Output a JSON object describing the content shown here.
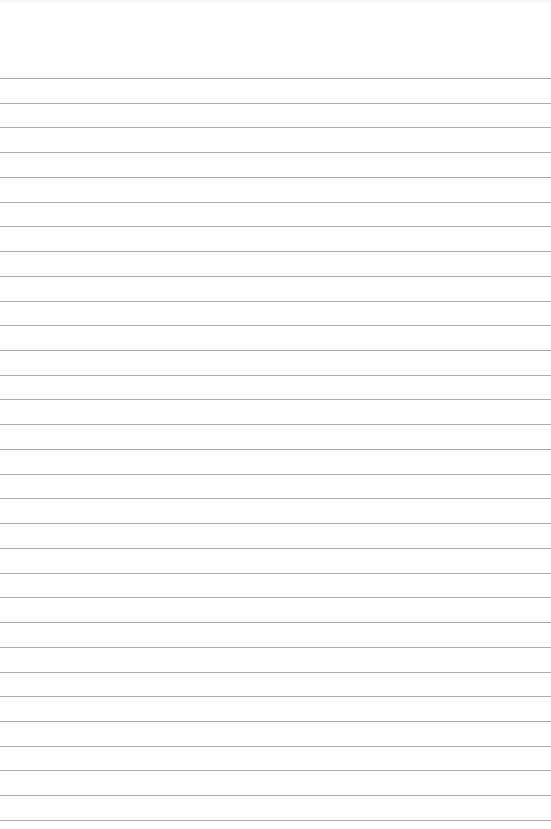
{
  "page": {
    "type": "lined-paper",
    "background_color": "#fefefe",
    "rule_color": "#9a9a9a",
    "first_rule_y": 78,
    "rule_spacing": 24.73,
    "rule_count": 31
  }
}
